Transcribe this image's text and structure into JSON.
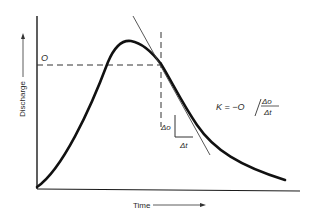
{
  "diagram": {
    "type": "hydrograph-recession",
    "axes": {
      "y_label": "Discharge",
      "x_label": "Time"
    },
    "labels": {
      "discharge_level": "O",
      "delta_o": "Δo",
      "delta_t": "Δt"
    },
    "formula": {
      "lhs": "K = −O",
      "numerator": "Δo",
      "denominator": "Δt"
    },
    "colors": {
      "ink": "#1a1a1a",
      "background": "#ffffff"
    }
  }
}
